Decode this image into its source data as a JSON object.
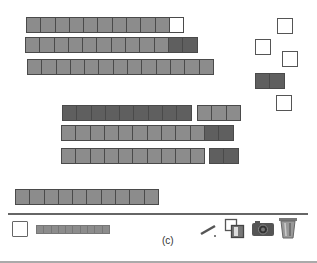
{
  "workspace": {
    "rods": [
      {
        "id": "row1",
        "x": 26,
        "y": 17,
        "segments": [
          {
            "color": "gray",
            "count": 10
          },
          {
            "color": "white",
            "count": 1
          }
        ]
      },
      {
        "id": "row2",
        "x": 25,
        "y": 37,
        "segments": [
          {
            "color": "gray",
            "count": 10
          },
          {
            "color": "dark",
            "count": 2
          }
        ]
      },
      {
        "id": "row3",
        "x": 27,
        "y": 59,
        "segments": [
          {
            "color": "gray",
            "count": 13
          }
        ]
      },
      {
        "id": "row4a",
        "x": 62,
        "y": 105,
        "segments": [
          {
            "color": "dark",
            "count": 9
          }
        ]
      },
      {
        "id": "row4b",
        "x": 197,
        "y": 105,
        "segments": [
          {
            "color": "gray",
            "count": 3
          }
        ]
      },
      {
        "id": "row5",
        "x": 61,
        "y": 125,
        "segments": [
          {
            "color": "gray",
            "count": 10
          },
          {
            "color": "dark",
            "count": 2
          }
        ]
      },
      {
        "id": "row6a",
        "x": 61,
        "y": 148,
        "segments": [
          {
            "color": "gray",
            "count": 10
          }
        ]
      },
      {
        "id": "row6b",
        "x": 209,
        "y": 148,
        "segments": [
          {
            "color": "dark",
            "count": 2
          }
        ]
      },
      {
        "id": "row7",
        "x": 15,
        "y": 189,
        "segments": [
          {
            "color": "gray",
            "count": 10
          }
        ]
      }
    ],
    "loose_units": [
      {
        "x": 277,
        "y": 18
      },
      {
        "x": 255,
        "y": 39
      },
      {
        "x": 282,
        "y": 51
      },
      {
        "x": 276,
        "y": 95
      }
    ],
    "dark_pair": {
      "x": 255,
      "y": 73,
      "count": 2
    }
  },
  "colors": {
    "gray": "#8c8c8c",
    "dark": "#5f5f5f",
    "white": "#ffffff",
    "border": "#4a4a4a"
  },
  "toolbar": {
    "palette_unit": "unit-square",
    "palette_rod_cells": 10,
    "caption": "(c)",
    "tools": [
      "pencil-icon",
      "overlap-squares-icon",
      "camera-icon",
      "trash-icon"
    ]
  }
}
